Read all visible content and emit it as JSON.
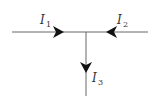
{
  "diagram": {
    "type": "circuit-junction",
    "wire_color": "#666666",
    "arrow_color": "#111111",
    "currents": [
      {
        "id": "I1",
        "symbol": "I",
        "subscript": "1",
        "direction": "right",
        "into_junction": true
      },
      {
        "id": "I2",
        "symbol": "I",
        "subscript": "2",
        "direction": "left",
        "into_junction": true
      },
      {
        "id": "I3",
        "symbol": "I",
        "subscript": "3",
        "direction": "down",
        "into_junction": false
      }
    ]
  }
}
